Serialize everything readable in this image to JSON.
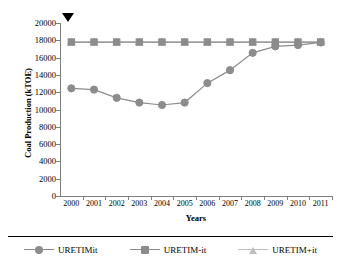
{
  "chart_data": {
    "type": "line",
    "title": "",
    "xlabel": "Years",
    "ylabel": "Coal Production (kTOE)",
    "x": [
      "2000",
      "2001",
      "2002",
      "2003",
      "2004",
      "2005",
      "2006",
      "2007",
      "2008",
      "2009",
      "2010",
      "2011"
    ],
    "categories": [
      "2000",
      "2001",
      "2002",
      "2003",
      "2004",
      "2005",
      "2006",
      "2007",
      "2008",
      "2009",
      "2010",
      "2011"
    ],
    "ylim": [
      0,
      20000
    ],
    "yticks": [
      "20000",
      "18000",
      "16000",
      "14000",
      "12000",
      "10000",
      "8000",
      "6000",
      "4000",
      "2000",
      "0"
    ],
    "ytick_values": [
      20000,
      18000,
      16000,
      14000,
      12000,
      10000,
      8000,
      6000,
      4000,
      2000,
      0
    ],
    "grid": false,
    "legend_position": "bottom",
    "series": [
      {
        "name": "URETIMit",
        "marker": "circle",
        "color": "#8c8c8c",
        "values": [
          12450,
          12300,
          11350,
          10800,
          10520,
          10800,
          13050,
          14550,
          16550,
          17300,
          17450,
          17750
        ]
      },
      {
        "name": "URETIM-it",
        "marker": "square",
        "color": "#8c8c8c",
        "values": [
          17800,
          17800,
          17800,
          17800,
          17800,
          17800,
          17800,
          17800,
          17800,
          17800,
          17800,
          17800
        ]
      },
      {
        "name": "URETIM+it",
        "marker": "triangle",
        "color": "#bfbfbf",
        "values": [
          17800,
          17800,
          17800,
          17800,
          17800,
          17800,
          17800,
          17800,
          17800,
          17800,
          17800,
          17800
        ]
      }
    ],
    "annotations": [
      {
        "name": "top-marker-arrow",
        "glyph": "▼",
        "color": "#000000"
      }
    ]
  },
  "legend": {
    "items": [
      {
        "label": "URETIMit",
        "marker": "circle",
        "color": "#8c8c8c"
      },
      {
        "label": "URETIM-it",
        "marker": "square",
        "color": "#8c8c8c"
      },
      {
        "label": "URETIM+it",
        "marker": "triangle",
        "color": "#bfbfbf"
      }
    ]
  },
  "colors": {
    "axis": "#7f7f7f",
    "series_dark": "#8c8c8c",
    "series_light": "#bfbfbf",
    "text": "#000000",
    "background": "#ffffff"
  }
}
